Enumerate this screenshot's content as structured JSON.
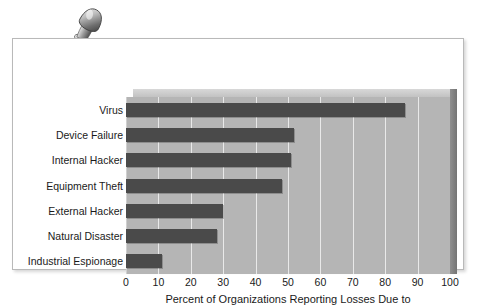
{
  "decoration": {
    "pushpin_icon": "pushpin-icon"
  },
  "chart_data": {
    "type": "bar",
    "orientation": "horizontal",
    "title": "",
    "subtitle": "",
    "xlabel": "Percent of Organizations Reporting Losses Due to",
    "ylabel": "",
    "xlim": [
      0,
      100
    ],
    "xticks": [
      0,
      10,
      20,
      30,
      40,
      50,
      60,
      70,
      80,
      90,
      100
    ],
    "xtick_labels": [
      "0",
      "10",
      "20",
      "30",
      "40",
      "50",
      "60",
      "70",
      "80",
      "90",
      "100"
    ],
    "grid": true,
    "grid_axis": "x",
    "legend": false,
    "legend_position": "none",
    "categories": [
      "Virus",
      "Device Failure",
      "Internal Hacker",
      "Equipment Theft",
      "External Hacker",
      "Natural Disaster",
      "Industrial Espionage"
    ],
    "values": [
      86,
      52,
      51,
      48,
      30,
      28,
      11
    ],
    "bar_color": "#4a4a4a",
    "plot_background_color": "#b5b5b5",
    "gridline_color": "#e9e9e9",
    "figure_background_color": "#ffffff"
  }
}
